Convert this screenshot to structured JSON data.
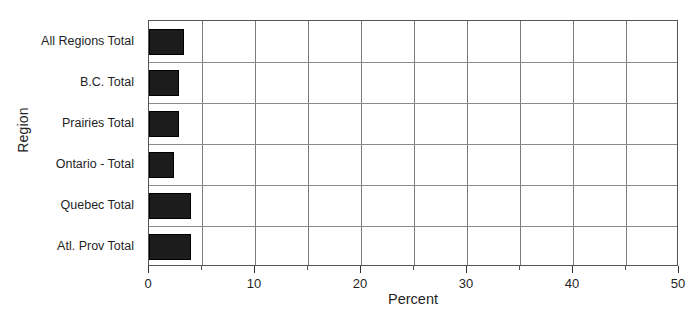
{
  "chart_data": {
    "type": "bar",
    "orientation": "horizontal",
    "title": "",
    "xlabel": "Percent",
    "ylabel": "Region",
    "categories": [
      "All Regions Total",
      "B.C. Total",
      "Prairies Total",
      "Ontario - Total",
      "Quebec Total",
      "Atl. Prov Total"
    ],
    "values": [
      3.3,
      2.8,
      2.8,
      2.4,
      4.0,
      4.0
    ],
    "xlim": [
      0,
      50
    ],
    "xticks": [
      0,
      10,
      20,
      30,
      40,
      50
    ],
    "xtick_labels": [
      "0",
      "10",
      "20",
      "30",
      "40",
      "50"
    ],
    "xminor_ticks": [
      5,
      15,
      25,
      35,
      45
    ],
    "grid": "vertical-major-and-minor-plus-horizontal-category-separators",
    "legend": "none",
    "bar_color": "#1c1c1c",
    "plot_border_color": "#555555",
    "gridline_color": "#7a7a7a",
    "background": "#ffffff"
  }
}
